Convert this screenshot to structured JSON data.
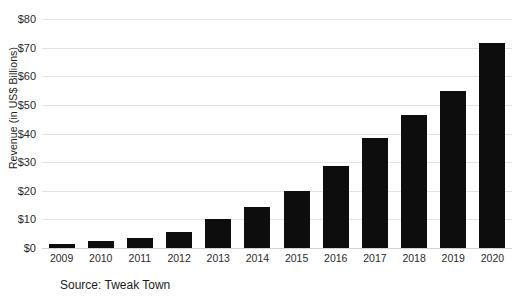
{
  "chart_data": {
    "type": "bar",
    "title": "",
    "subtitle": "",
    "xlabel": "",
    "ylabel": "Revenue (in US$ Billions)",
    "categories": [
      "2009",
      "2010",
      "2011",
      "2012",
      "2013",
      "2014",
      "2015",
      "2016",
      "2017",
      "2018",
      "2019",
      "2020"
    ],
    "values": [
      1.5,
      2.5,
      3.5,
      5.5,
      10,
      14.5,
      20,
      28.5,
      38.5,
      46.5,
      55,
      71.5
    ],
    "series": [
      {
        "name": "Revenue",
        "values": [
          1.5,
          2.5,
          3.5,
          5.5,
          10,
          14.5,
          20,
          28.5,
          38.5,
          46.5,
          55,
          71.5
        ]
      }
    ],
    "ylim": [
      0,
      80
    ],
    "ytick_values": [
      0,
      10,
      20,
      30,
      40,
      50,
      60,
      70,
      80
    ],
    "ytick_labels": [
      "$0",
      "$10",
      "$20",
      "$30",
      "$40",
      "$50",
      "$60",
      "$70",
      "$80"
    ],
    "grid": true,
    "legend": false,
    "legend_position": "none",
    "bar_color": "#0d0d0d",
    "gridline_color": "#e4e4e4",
    "background_color": "#ffffff",
    "annotations": [
      "Source: Tweak Town"
    ]
  },
  "footer": {
    "source_text": "Source: Tweak Town"
  }
}
